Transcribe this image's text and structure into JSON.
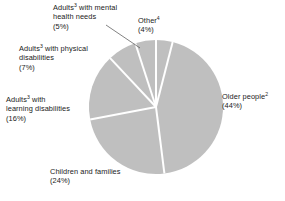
{
  "chart_data": {
    "type": "pie",
    "title": "",
    "subtitle": "",
    "xlabel": "",
    "ylabel": "",
    "legend_position": "none",
    "grid": false,
    "slice_color": "#bfbfbf",
    "separator_color": "#ffffff",
    "start_angle_deg": 0,
    "direction": "clockwise",
    "categories": [
      "Other",
      "Older people",
      "Children and families",
      "Adults with learning disabilities",
      "Adults with physical disabilities",
      "Adults with mental health needs"
    ],
    "values": [
      4,
      44,
      24,
      16,
      7,
      5
    ],
    "units": "percent",
    "total": 100,
    "slices": [
      {
        "label_line1": "Other",
        "label_line2": "",
        "superscript": "4",
        "value_label": "(4%)",
        "value": 4
      },
      {
        "label_line1": "Older people",
        "label_line2": "",
        "superscript": "2",
        "value_label": "(44%)",
        "value": 44
      },
      {
        "label_line1": "Children and families",
        "label_line2": "",
        "superscript": "",
        "value_label": "(24%)",
        "value": 24
      },
      {
        "label_line1": "Adults",
        "label_line2": "learning disabilities",
        "label_line1_tail": " with",
        "superscript": "3",
        "value_label": "(16%)",
        "value": 16
      },
      {
        "label_line1": "Adults",
        "label_line2": "disabilities",
        "label_line1_tail": " with physical",
        "superscript": "3",
        "value_label": "(7%)",
        "value": 7
      },
      {
        "label_line1": "Adults",
        "label_line2": "health needs",
        "label_line1_tail": " with mental",
        "superscript": "3",
        "value_label": "(5%)",
        "value": 5
      }
    ]
  },
  "geometry": {
    "center_x": 156,
    "center_y": 107,
    "radius": 67
  }
}
